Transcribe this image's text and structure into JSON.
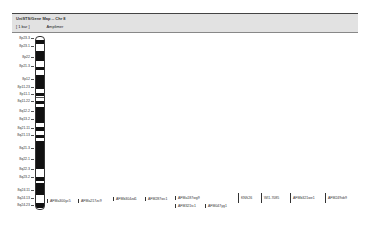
{
  "header": {
    "title": "UniSTS/Gene Map -- Chr 8",
    "scale_label": "[ 1 bar ]",
    "track_label": "Amplimer"
  },
  "bands": [
    {
      "label": "8p23.3",
      "y": 38
    },
    {
      "label": "8p23.1",
      "y": 46
    },
    {
      "label": "8p22",
      "y": 57
    },
    {
      "label": "8p21.3",
      "y": 66
    },
    {
      "label": "8p12",
      "y": 79
    },
    {
      "label": "8p11.23",
      "y": 87
    },
    {
      "label": "8p11.1",
      "y": 94
    },
    {
      "label": "8q11.22",
      "y": 101
    },
    {
      "label": "8q12.2",
      "y": 111
    },
    {
      "label": "8q13.2",
      "y": 119
    },
    {
      "label": "8q21.11",
      "y": 128
    },
    {
      "label": "8q21.13",
      "y": 135
    },
    {
      "label": "8q21.3",
      "y": 148
    },
    {
      "label": "8q22.1",
      "y": 159
    },
    {
      "label": "8q22.3",
      "y": 169
    },
    {
      "label": "8q23.2",
      "y": 177
    },
    {
      "label": "8q24.11",
      "y": 190
    },
    {
      "label": "8q24.13",
      "y": 198
    },
    {
      "label": "8q24.23",
      "y": 205
    }
  ],
  "dark_bands": [
    {
      "top": 3,
      "h": 4
    },
    {
      "top": 14,
      "h": 10
    },
    {
      "top": 30,
      "h": 3
    },
    {
      "top": 38,
      "h": 14
    },
    {
      "top": 56,
      "h": 3
    },
    {
      "top": 64,
      "h": 3
    },
    {
      "top": 70,
      "h": 16
    },
    {
      "top": 90,
      "h": 4
    },
    {
      "top": 98,
      "h": 3
    },
    {
      "top": 104,
      "h": 28
    },
    {
      "top": 140,
      "h": 4
    },
    {
      "top": 146,
      "h": 12
    },
    {
      "top": 166,
      "h": 5
    }
  ],
  "markers": [
    {
      "label": "AFMa300yc5",
      "x": 47,
      "y": 199,
      "style": "dot"
    },
    {
      "label": "AFMa217zc9",
      "x": 78,
      "y": 199,
      "style": "dot"
    },
    {
      "label": "AFMb304zd1",
      "x": 113,
      "y": 197,
      "style": "dot"
    },
    {
      "label": "AFM287wc1",
      "x": 145,
      "y": 197,
      "style": "dot"
    },
    {
      "label": "AFMa187wg9",
      "x": 175,
      "y": 196,
      "style": "dot"
    },
    {
      "label": "AFM321tc1",
      "x": 175,
      "y": 204,
      "style": "dot"
    },
    {
      "label": "AFM047yg1",
      "x": 205,
      "y": 204,
      "style": "dot"
    },
    {
      "label": "KNS26",
      "x": 238,
      "y": 193,
      "style": "bar"
    },
    {
      "label": "WI1-7085",
      "x": 261,
      "y": 193,
      "style": "bar"
    },
    {
      "label": "AFMb321we1",
      "x": 290,
      "y": 193,
      "style": "bar"
    },
    {
      "label": "AFM249xb9",
      "x": 325,
      "y": 193,
      "style": "bar"
    }
  ]
}
